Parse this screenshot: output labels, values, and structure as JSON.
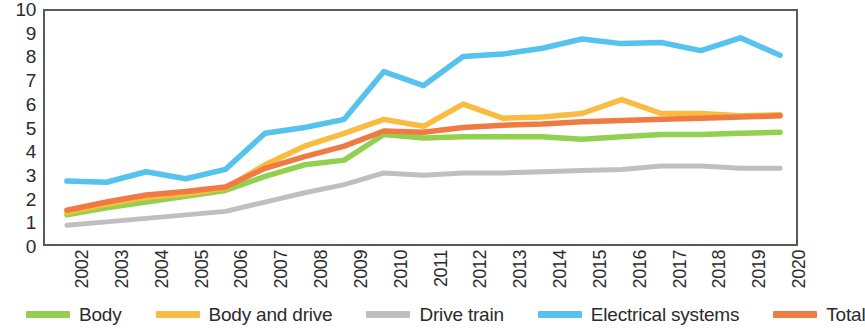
{
  "chart_data": {
    "type": "line",
    "title": "",
    "subtitle": "",
    "xlabel": "",
    "ylabel": "",
    "xlim": [
      2002,
      2020
    ],
    "ylim": [
      0,
      10
    ],
    "grid": false,
    "legend_position": "bottom",
    "x": [
      2002,
      2003,
      2004,
      2005,
      2006,
      2007,
      2008,
      2009,
      2010,
      2011,
      2012,
      2013,
      2014,
      2015,
      2016,
      2017,
      2018,
      2019,
      2020
    ],
    "categories": [
      "2002",
      "2003",
      "2004",
      "2005",
      "2006",
      "2007",
      "2008",
      "2009",
      "2010",
      "2011",
      "2012",
      "2013",
      "2014",
      "2015",
      "2016",
      "2017",
      "2018",
      "2019",
      "2020"
    ],
    "yticks": [
      0,
      1,
      2,
      3,
      4,
      5,
      6,
      7,
      8,
      9,
      10
    ],
    "ytick_labels": [
      "0",
      "1",
      "2",
      "3",
      "4",
      "5",
      "6",
      "7",
      "8",
      "9",
      "10"
    ],
    "series": [
      {
        "name": "Body",
        "color": "#92D14F",
        "values": [
          1.25,
          1.55,
          1.8,
          2.05,
          2.3,
          2.9,
          3.4,
          3.6,
          4.7,
          4.55,
          4.6,
          4.6,
          4.6,
          4.5,
          4.6,
          4.7,
          4.7,
          4.75,
          4.8
        ]
      },
      {
        "name": "Body and drive",
        "color": "#F9BC40",
        "values": [
          1.35,
          1.7,
          2.0,
          2.15,
          2.4,
          3.4,
          4.2,
          4.75,
          5.35,
          5.05,
          6.0,
          5.4,
          5.45,
          5.6,
          6.2,
          5.6,
          5.6,
          5.5,
          5.55
        ]
      },
      {
        "name": "Drive train",
        "color": "#BFBFBF",
        "values": [
          0.8,
          0.95,
          1.1,
          1.25,
          1.4,
          1.8,
          2.2,
          2.55,
          3.05,
          2.95,
          3.05,
          3.05,
          3.1,
          3.15,
          3.2,
          3.35,
          3.35,
          3.25,
          3.25
        ]
      },
      {
        "name": "Electrical systems",
        "color": "#55C3ED",
        "values": [
          2.7,
          2.65,
          3.1,
          2.8,
          3.2,
          4.75,
          5.0,
          5.35,
          7.4,
          6.8,
          8.05,
          8.15,
          8.4,
          8.8,
          8.6,
          8.65,
          8.3,
          8.85,
          8.1
        ]
      },
      {
        "name": "Total",
        "color": "#EF7B43",
        "values": [
          1.45,
          1.8,
          2.1,
          2.25,
          2.45,
          3.25,
          3.75,
          4.2,
          4.85,
          4.8,
          5.0,
          5.1,
          5.15,
          5.25,
          5.3,
          5.35,
          5.4,
          5.45,
          5.5
        ]
      }
    ]
  },
  "legend": {
    "items": [
      {
        "label": "Body",
        "color": "#92D14F"
      },
      {
        "label": "Body and drive",
        "color": "#F9BC40"
      },
      {
        "label": "Drive train",
        "color": "#BFBFBF"
      },
      {
        "label": "Electrical systems",
        "color": "#55C3ED"
      },
      {
        "label": "Total",
        "color": "#EF7B43"
      }
    ]
  },
  "axes": {
    "y_labels": [
      "10",
      "9",
      "8",
      "7",
      "6",
      "5",
      "4",
      "3",
      "2",
      "1",
      "0"
    ],
    "x_labels": [
      "2002",
      "2003",
      "2004",
      "2005",
      "2006",
      "2007",
      "2008",
      "2009",
      "2010",
      "2011",
      "2012",
      "2013",
      "2014",
      "2015",
      "2016",
      "2017",
      "2018",
      "2019",
      "2020"
    ]
  }
}
